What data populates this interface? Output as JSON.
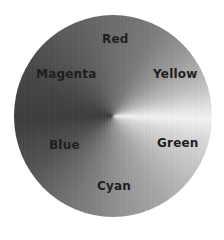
{
  "diagram": {
    "type": "color-wheel",
    "rendering": "grayscale",
    "labels": [
      {
        "name": "Red",
        "position": "top"
      },
      {
        "name": "Yellow",
        "position": "upper-right"
      },
      {
        "name": "Green",
        "position": "lower-right"
      },
      {
        "name": "Cyan",
        "position": "bottom"
      },
      {
        "name": "Blue",
        "position": "lower-left"
      },
      {
        "name": "Magenta",
        "position": "upper-left"
      }
    ]
  }
}
